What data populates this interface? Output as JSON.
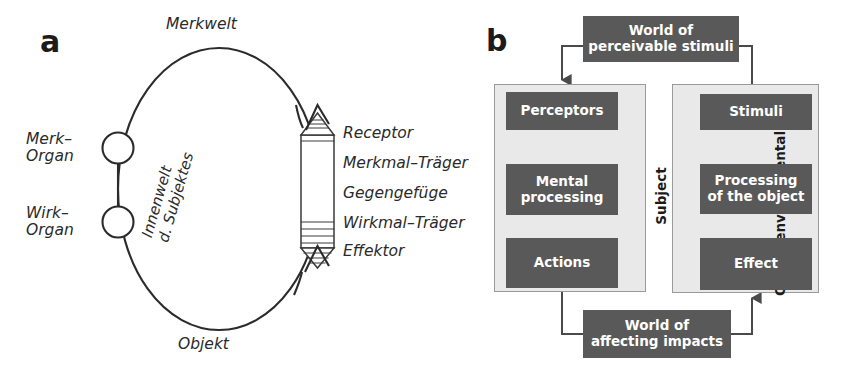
{
  "figure": {
    "panels": [
      {
        "letter": "a"
      },
      {
        "letter": "b"
      }
    ]
  },
  "panel_a": {
    "letter": "a",
    "labels": {
      "top": "Merkwelt",
      "bottom": "Objekt",
      "merk_organ": "Merk–\nOrgan",
      "wirk_organ": "Wirk–\nOrgan",
      "inner_world": "Innenwelt\nd. Subjektes",
      "receptor": "Receptor",
      "merkmal_traeger": "Merkmal–Träger",
      "gegengefuege": "Gegengefüge",
      "wirkmal_traeger": "Wirkmal–Träger",
      "effektor": "Effektor"
    }
  },
  "panel_b": {
    "letter": "b",
    "top_box": "World of\nperceivable stimuli",
    "bottom_box": "World of\naffecting impacts",
    "subject": {
      "container_label": "Subject",
      "boxes": [
        {
          "label": "Perceptors"
        },
        {
          "label": "Mental\nprocessing"
        },
        {
          "label": "Actions"
        }
      ]
    },
    "object_unit": {
      "container_label": "Object/environmental unit",
      "boxes": [
        {
          "label": "Stimuli"
        },
        {
          "label": "Processing\nof the object"
        },
        {
          "label": "Effect"
        }
      ]
    }
  },
  "colors": {
    "box_fill": "#595959",
    "box_text": "#ffffff",
    "container_fill": "#e9e9e9",
    "container_border": "#9a9a9a",
    "line": "#3a3a3a",
    "text": "#2a2a2a"
  }
}
